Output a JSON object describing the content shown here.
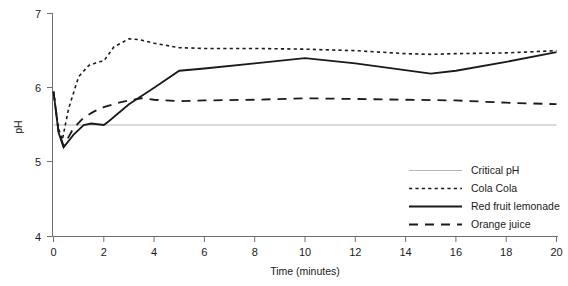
{
  "chart_data": {
    "type": "line",
    "title": "",
    "xlabel": "Time (minutes)",
    "ylabel": "pH",
    "xlim": [
      0,
      20
    ],
    "ylim": [
      4,
      7
    ],
    "xticks": [
      0,
      2,
      4,
      6,
      8,
      10,
      12,
      14,
      16,
      18,
      20
    ],
    "xtick_labels": [
      "0",
      "2",
      "4",
      "6",
      "8",
      "10",
      "12",
      "14",
      "16",
      "18",
      "20"
    ],
    "yticks": [
      4,
      5,
      6,
      7
    ],
    "ytick_labels": [
      "4",
      "5",
      "6",
      "7"
    ],
    "grid": false,
    "legend_position": "lower right",
    "series": [
      {
        "name": "Critical pH",
        "style": "solid-thin",
        "color": "#b4b4b4",
        "constant_value": 5.5,
        "x": [
          0,
          20
        ],
        "values": [
          5.5,
          5.5
        ]
      },
      {
        "name": "Cola Cola",
        "style": "dotted",
        "color": "#1a1a1a",
        "x": [
          0,
          0.2,
          0.35,
          0.6,
          1.0,
          1.4,
          1.8,
          2.0,
          2.4,
          3.0,
          3.4,
          4.0,
          5.0,
          6.0,
          8.0,
          10.0,
          12.0,
          14.0,
          15.0,
          16.0,
          18.0,
          20.0
        ],
        "values": [
          5.95,
          5.45,
          5.3,
          5.72,
          6.15,
          6.3,
          6.35,
          6.36,
          6.55,
          6.66,
          6.65,
          6.6,
          6.54,
          6.53,
          6.53,
          6.52,
          6.5,
          6.46,
          6.45,
          6.46,
          6.47,
          6.5
        ]
      },
      {
        "name": "Red fruit lemonade",
        "style": "solid",
        "color": "#1a1a1a",
        "x": [
          0,
          0.2,
          0.4,
          0.8,
          1.2,
          1.5,
          2.0,
          2.2,
          3.0,
          4.0,
          5.0,
          6.0,
          8.0,
          10.0,
          12.0,
          15.0,
          16.0,
          18.0,
          20.0
        ],
        "values": [
          5.95,
          5.4,
          5.2,
          5.37,
          5.5,
          5.52,
          5.5,
          5.55,
          5.78,
          6.0,
          6.23,
          6.26,
          6.33,
          6.4,
          6.33,
          6.19,
          6.23,
          6.35,
          6.48
        ]
      },
      {
        "name": "Orange juice",
        "style": "dashed",
        "color": "#1a1a1a",
        "x": [
          0,
          0.2,
          0.4,
          0.8,
          1.2,
          1.6,
          2.0,
          2.6,
          3.0,
          3.5,
          4.0,
          5.0,
          6.0,
          8.0,
          10.0,
          12.0,
          14.0,
          16.0,
          18.0,
          20.0
        ],
        "values": [
          5.95,
          5.42,
          5.22,
          5.46,
          5.6,
          5.68,
          5.74,
          5.8,
          5.83,
          5.86,
          5.84,
          5.82,
          5.83,
          5.84,
          5.86,
          5.85,
          5.84,
          5.83,
          5.8,
          5.78
        ]
      }
    ]
  },
  "legend": {
    "items": [
      {
        "label": "Critical pH",
        "swatch": "solid-thin-gray"
      },
      {
        "label": "Cola Cola",
        "swatch": "dotted-black"
      },
      {
        "label": "Red fruit lemonade",
        "swatch": "solid-black"
      },
      {
        "label": "Orange juice",
        "swatch": "dashed-black"
      }
    ]
  },
  "colors": {
    "axis": "#6f6f6f",
    "series_black": "#1a1a1a",
    "critical_gray": "#b4b4b4",
    "background": "#ffffff"
  }
}
